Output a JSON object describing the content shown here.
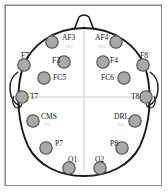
{
  "figure": {
    "type": "eeg-electrode-placement-diagram",
    "view": "top-down head map",
    "colors": {
      "electrode_fill": "#a9a9a9",
      "electrode_stroke": "#4a4a4a",
      "head_outline": "#1a1a1a",
      "midline": "#cccccc",
      "label": "#111111",
      "sublabel": "#c2c2c2",
      "frame": "#8d8d8d",
      "background": "#ffffff"
    },
    "head": {
      "nose_position": "top-center",
      "ears": [
        "left",
        "right"
      ],
      "midlines": [
        "vertical",
        "horizontal"
      ]
    },
    "electrodes": [
      {
        "id": "AF3",
        "label": "AF3",
        "sublabel": "FP1",
        "side": "left",
        "cx": 52,
        "cy": 42,
        "label_x": 62,
        "label_y": 34,
        "sub_x": 65,
        "sub_y": 44
      },
      {
        "id": "AF4",
        "label": "AF4",
        "sublabel": "FP2",
        "side": "right",
        "cx": 116,
        "cy": 42,
        "label_x": 95,
        "label_y": 34,
        "sub_x": 98,
        "sub_y": 44
      },
      {
        "id": "F7",
        "label": "F7",
        "sublabel": "",
        "side": "left",
        "cx": 24,
        "cy": 65,
        "label_x": 21,
        "label_y": 52,
        "sub_x": 0,
        "sub_y": 0
      },
      {
        "id": "F8",
        "label": "F8",
        "sublabel": "",
        "side": "right",
        "cx": 143,
        "cy": 65,
        "label_x": 140,
        "label_y": 52,
        "sub_x": 0,
        "sub_y": 0
      },
      {
        "id": "F3",
        "label": "F3",
        "sublabel": "",
        "side": "left",
        "cx": 64,
        "cy": 62,
        "label_x": 52,
        "label_y": 57,
        "sub_x": 0,
        "sub_y": 0
      },
      {
        "id": "F4",
        "label": "F4",
        "sublabel": "",
        "side": "right",
        "cx": 103,
        "cy": 62,
        "label_x": 110,
        "label_y": 57,
        "sub_x": 0,
        "sub_y": 0
      },
      {
        "id": "FC5",
        "label": "FC5",
        "sublabel": "",
        "side": "left",
        "cx": 44,
        "cy": 78,
        "label_x": 53,
        "label_y": 74,
        "sub_x": 0,
        "sub_y": 0
      },
      {
        "id": "FC6",
        "label": "FC6",
        "sublabel": "",
        "side": "right",
        "cx": 124,
        "cy": 78,
        "label_x": 101,
        "label_y": 74,
        "sub_x": 0,
        "sub_y": 0
      },
      {
        "id": "T7",
        "label": "T7",
        "sublabel": "",
        "side": "left",
        "cx": 22,
        "cy": 97,
        "label_x": 30,
        "label_y": 93,
        "sub_x": 0,
        "sub_y": 0
      },
      {
        "id": "T8",
        "label": "T8",
        "sublabel": "",
        "side": "right",
        "cx": 146,
        "cy": 97,
        "label_x": 131,
        "label_y": 93,
        "sub_x": 0,
        "sub_y": 0
      },
      {
        "id": "CMS",
        "label": "CMS",
        "sublabel": "P3",
        "side": "left",
        "cx": 33,
        "cy": 121,
        "label_x": 41,
        "label_y": 113,
        "sub_x": 45,
        "sub_y": 122
      },
      {
        "id": "DRL",
        "label": "DRL",
        "sublabel": "P4",
        "side": "right",
        "cx": 135,
        "cy": 121,
        "label_x": 114,
        "label_y": 113,
        "sub_x": 118,
        "sub_y": 122
      },
      {
        "id": "P7",
        "label": "P7",
        "sublabel": "",
        "side": "left",
        "cx": 46,
        "cy": 148,
        "label_x": 55,
        "label_y": 140,
        "sub_x": 0,
        "sub_y": 0
      },
      {
        "id": "P8",
        "label": "P8",
        "sublabel": "",
        "side": "right",
        "cx": 122,
        "cy": 148,
        "label_x": 110,
        "label_y": 140,
        "sub_x": 0,
        "sub_y": 0
      },
      {
        "id": "O1",
        "label": "O1",
        "sublabel": "",
        "side": "left",
        "cx": 69,
        "cy": 168,
        "label_x": 68,
        "label_y": 156,
        "sub_x": 0,
        "sub_y": 0
      },
      {
        "id": "O2",
        "label": "O2",
        "sublabel": "",
        "side": "right",
        "cx": 100,
        "cy": 168,
        "label_x": 95,
        "label_y": 156,
        "sub_x": 0,
        "sub_y": 0
      }
    ]
  }
}
